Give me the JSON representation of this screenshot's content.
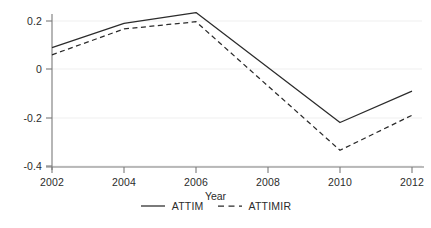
{
  "chart_data": {
    "type": "line",
    "title": "",
    "xlabel": "Year",
    "ylabel": "",
    "x": [
      2002,
      2004,
      2006,
      2010,
      2012
    ],
    "xticks": [
      "2002",
      "2004",
      "2006",
      "2008",
      "2010",
      "2012"
    ],
    "yticks": [
      "0.2",
      "0",
      "-0.2",
      "-0.4"
    ],
    "ytick_values": [
      0.2,
      0,
      -0.2,
      -0.4
    ],
    "xlim": [
      2002,
      2012
    ],
    "ylim": [
      -0.42,
      0.26
    ],
    "grid": true,
    "legend_position": "bottom",
    "series": [
      {
        "name": "ATTIM",
        "style": "solid",
        "color": "#2b2b2b",
        "x": [
          2002,
          2004,
          2006,
          2010,
          2012
        ],
        "values": [
          0.09,
          0.19,
          0.235,
          -0.22,
          -0.09
        ]
      },
      {
        "name": "ATTIMIR",
        "style": "dashed",
        "color": "#2b2b2b",
        "x": [
          2002,
          2004,
          2006,
          2010,
          2012
        ],
        "values": [
          0.06,
          0.167,
          0.197,
          -0.335,
          -0.19
        ]
      }
    ]
  },
  "axes": {
    "x_title": "Year",
    "x_tick_labels": [
      "2002",
      "2004",
      "2006",
      "2008",
      "2010",
      "2012"
    ],
    "y_tick_labels": [
      "0.2",
      "0",
      "-0.2",
      "-0.4"
    ]
  },
  "legend": {
    "items": [
      {
        "label": "ATTIM",
        "style": "solid"
      },
      {
        "label": "ATTIMIR",
        "style": "dashed"
      }
    ]
  },
  "colors": {
    "line": "#2b2b2b",
    "axis": "#7a7a7a",
    "grid": "#efefef",
    "background": "#ffffff",
    "text": "#2b2b2b"
  }
}
